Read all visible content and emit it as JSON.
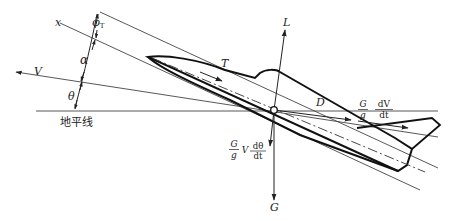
{
  "diagram": {
    "type": "aircraft flight force diagram",
    "labels": {
      "x_axis": "x",
      "phi_T": "φ",
      "phi_T_sub": "T",
      "alpha": "α",
      "velocity": "V",
      "theta": "θ",
      "horizon": "地平线",
      "lift": "L",
      "thrust": "T",
      "drag": "D",
      "weight": "G",
      "inertia_tangential": {
        "num1": "G",
        "den1": "g",
        "num2": "dV",
        "den2": "dt"
      },
      "inertia_normal": {
        "num1": "G",
        "den1": "g",
        "mid": "V",
        "num2": "dθ",
        "den2": "dt"
      }
    },
    "colors": {
      "line": "#222222",
      "background": "#ffffff"
    },
    "center_point": [
      274,
      110
    ]
  }
}
